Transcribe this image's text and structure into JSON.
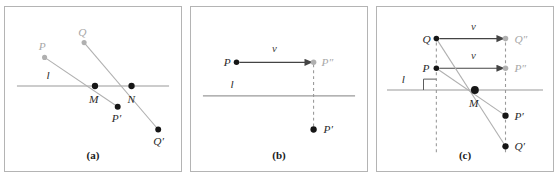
{
  "figure": {
    "type": "geometry-diagram",
    "panels": [
      {
        "id": "a",
        "caption": "(a)",
        "line_label": "l",
        "points": [
          {
            "name": "P",
            "label": "P",
            "style": "ghost",
            "x": 40,
            "y": 51
          },
          {
            "name": "Q",
            "label": "Q",
            "style": "ghost",
            "x": 80,
            "y": 36
          },
          {
            "name": "M",
            "label": "M",
            "style": "solid",
            "x": 91,
            "y": 80
          },
          {
            "name": "N",
            "label": "N",
            "style": "solid",
            "x": 128,
            "y": 80
          },
          {
            "name": "Pp",
            "label": "P′",
            "style": "solid",
            "x": 114,
            "y": 101
          },
          {
            "name": "Qp",
            "label": "Q′",
            "style": "solid",
            "x": 155,
            "y": 124
          }
        ]
      },
      {
        "id": "b",
        "caption": "(b)",
        "line_label": "l",
        "vector_label": "v",
        "points": [
          {
            "name": "P",
            "label": "P",
            "style": "solid",
            "x": 46,
            "y": 56
          },
          {
            "name": "Pdp",
            "label": "P″",
            "style": "ghost",
            "x": 124,
            "y": 56
          },
          {
            "name": "Pp",
            "label": "P′",
            "style": "solid",
            "x": 124,
            "y": 124
          }
        ]
      },
      {
        "id": "c",
        "caption": "(c)",
        "line_label": "l",
        "vector_label_top": "v",
        "vector_label_mid": "v",
        "points": [
          {
            "name": "Q",
            "label": "Q",
            "style": "solid",
            "x": 60,
            "y": 32
          },
          {
            "name": "Qdp",
            "label": "Q″",
            "style": "ghost",
            "x": 130,
            "y": 32
          },
          {
            "name": "P",
            "label": "P",
            "style": "solid",
            "x": 60,
            "y": 62
          },
          {
            "name": "Pdp",
            "label": "P″",
            "style": "ghost",
            "x": 130,
            "y": 62
          },
          {
            "name": "M",
            "label": "M",
            "style": "solid",
            "x": 99,
            "y": 84
          },
          {
            "name": "Pp",
            "label": "P′",
            "style": "solid",
            "x": 130,
            "y": 110
          },
          {
            "name": "Qp",
            "label": "Q′",
            "style": "solid",
            "x": 130,
            "y": 141
          }
        ]
      }
    ]
  },
  "colors": {
    "frame": "#b4b4b4",
    "line": "#9a9a9a",
    "ray": "#b0b0b0",
    "vector": "#444444",
    "dot_solid": "#161616",
    "dot_ghost": "#b0b0b0",
    "label": "#2b2b2b",
    "label_ghost": "#a8a8a8",
    "background": "#ffffff"
  }
}
